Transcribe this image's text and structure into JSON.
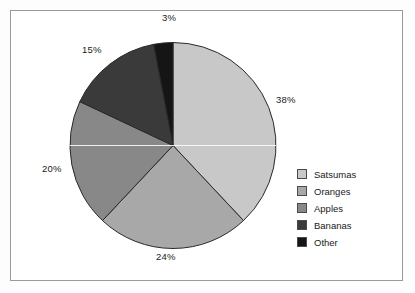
{
  "chart_data": {
    "type": "pie",
    "title": "",
    "categories": [
      "Satsumas",
      "Oranges",
      "Apples",
      "Bananas",
      "Other"
    ],
    "values": [
      38,
      24,
      20,
      15,
      3
    ],
    "value_unit": "%",
    "data_labels": [
      "38%",
      "24%",
      "20%",
      "15%",
      "3%"
    ],
    "colors": [
      "#c8c8c8",
      "#a8a8a8",
      "#888888",
      "#3a3a3a",
      "#151515"
    ],
    "start_angle_deg": 0,
    "direction": "clockwise",
    "legend_position": "right",
    "grid": false,
    "slice_outline_color": "#2a2a2a",
    "background_color": "#ffffff",
    "border_color": "#9a9a9a"
  },
  "labels": {
    "satsumas_pct": "38%",
    "oranges_pct": "24%",
    "apples_pct": "20%",
    "bananas_pct": "15%",
    "other_pct": "3%"
  },
  "legend": {
    "items": [
      {
        "label": "Satsumas",
        "color": "#c8c8c8"
      },
      {
        "label": "Oranges",
        "color": "#a8a8a8"
      },
      {
        "label": "Apples",
        "color": "#888888"
      },
      {
        "label": "Bananas",
        "color": "#3a3a3a"
      },
      {
        "label": "Other",
        "color": "#151515"
      }
    ]
  }
}
